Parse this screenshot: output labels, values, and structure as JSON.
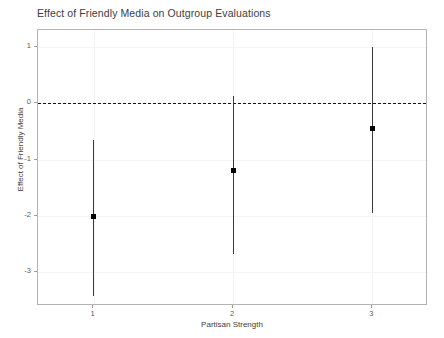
{
  "chart_data": {
    "type": "scatter",
    "title": "Effect of Friendly Media on Outgroup Evaluations",
    "xlabel": "Partisan Strength",
    "ylabel": "Effect of Friendly Media",
    "x": [
      1,
      2,
      3
    ],
    "xtick_labels": [
      "1",
      "2",
      "3"
    ],
    "ytick_labels": [
      "1",
      "0",
      "-1",
      "-2",
      "-3"
    ],
    "ytick_values": [
      1,
      0,
      -1,
      -2,
      -3
    ],
    "xlim": [
      0.6,
      3.4
    ],
    "ylim": [
      -3.6,
      1.3
    ],
    "grid": true,
    "legend": "none",
    "values": [
      -2.01,
      -1.19,
      -0.44
    ],
    "ci_lower": [
      -3.42,
      -2.68,
      -1.95
    ],
    "ci_upper": [
      -0.65,
      0.12,
      1.0
    ],
    "series": [
      {
        "name": "Effect of Friendly Media",
        "points": [
          {
            "x": 1,
            "estimate": -2.01,
            "ci_low": -3.42,
            "ci_high": -0.65
          },
          {
            "x": 2,
            "estimate": -1.19,
            "ci_low": -2.68,
            "ci_high": 0.12
          },
          {
            "x": 3,
            "estimate": -0.44,
            "ci_low": -1.95,
            "ci_high": 1.0
          }
        ]
      }
    ],
    "annotations": [
      {
        "type": "hline",
        "y": 0,
        "style": "dashed",
        "color": "#111111"
      }
    ],
    "colors": {
      "point": "#000000",
      "errorbar": "#3a3a3a",
      "zero_line": "#111111",
      "panel_border": "#b4b4b4",
      "gridline": "#f4f4f4",
      "text": "#3d3d3d"
    }
  }
}
